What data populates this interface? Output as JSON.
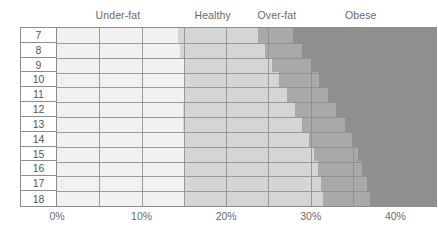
{
  "header": {
    "bands": [
      {
        "label": "Under-fat",
        "center_pct": 7.2
      },
      {
        "label": "Healthy",
        "center_pct": 18.4
      },
      {
        "label": "Over-fat",
        "center_pct": 26.0
      },
      {
        "label": "Obese",
        "center_pct": 35.9
      }
    ]
  },
  "axis": {
    "ticks": [
      "0%",
      "10%",
      "20%",
      "30%",
      "40%"
    ],
    "tick_values": [
      0,
      10,
      20,
      30,
      40
    ],
    "min": 0,
    "max": 44.8,
    "gridline_step_pct": 5
  },
  "colors": {
    "under_fat": "#f1f1f1",
    "healthy": "#d5d5d5",
    "over_fat": "#a9a9a9",
    "obese": "#8f8f8f",
    "grid": "#8d8d8d",
    "text": "#6a6a6a"
  },
  "chart_data": {
    "type": "bar",
    "title": "",
    "xlabel": "",
    "ylabel": "",
    "orientation": "horizontal",
    "stacked": true,
    "xlim": [
      0,
      44.8
    ],
    "grid": true,
    "legend_position": "top",
    "categories": [
      "7",
      "8",
      "9",
      "10",
      "11",
      "12",
      "13",
      "14",
      "15",
      "16",
      "17",
      "18"
    ],
    "series": [
      {
        "name": "Under-fat",
        "color": "#f1f1f1",
        "boundary_pct": [
          14.3,
          14.5,
          15.0,
          15.0,
          15.0,
          14.9,
          14.9,
          15.0,
          15.0,
          15.0,
          15.0,
          15.1
        ]
      },
      {
        "name": "Healthy",
        "color": "#d5d5d5",
        "boundary_pct": [
          23.8,
          24.6,
          25.4,
          26.3,
          27.2,
          28.1,
          29.0,
          29.8,
          30.4,
          30.8,
          31.2,
          31.5
        ]
      },
      {
        "name": "Over-fat",
        "color": "#a9a9a9",
        "boundary_pct": [
          27.9,
          29.0,
          30.0,
          31.0,
          32.0,
          33.0,
          34.0,
          34.9,
          35.6,
          36.1,
          36.6,
          37.0
        ]
      },
      {
        "name": "Obese",
        "color": "#8f8f8f",
        "boundary_pct": [
          44.8,
          44.8,
          44.8,
          44.8,
          44.8,
          44.8,
          44.8,
          44.8,
          44.8,
          44.8,
          44.8,
          44.8
        ]
      }
    ]
  }
}
